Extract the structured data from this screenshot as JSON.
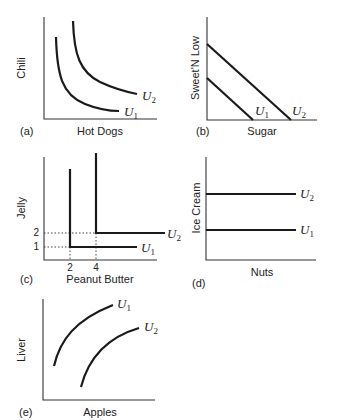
{
  "panels": {
    "a": {
      "tag": "(a)",
      "xlabel": "Hot Dogs",
      "ylabel": "Chili",
      "curves": [
        {
          "name": "U",
          "sub": "1"
        },
        {
          "name": "U",
          "sub": "2"
        }
      ],
      "shape": "convex indifference curves"
    },
    "b": {
      "tag": "(b)",
      "xlabel": "Sugar",
      "ylabel": "Sweet'N Low",
      "curves": [
        {
          "name": "U",
          "sub": "1"
        },
        {
          "name": "U",
          "sub": "2"
        }
      ],
      "shape": "perfect substitutes (straight lines)"
    },
    "c": {
      "tag": "(c)",
      "xlabel": "Peanut Butter",
      "ylabel": "Jelly",
      "curves": [
        {
          "name": "U",
          "sub": "1"
        },
        {
          "name": "U",
          "sub": "2"
        }
      ],
      "xticks": [
        "2",
        "4"
      ],
      "yticks": [
        "1",
        "2"
      ],
      "shape": "perfect complements (L-shaped)"
    },
    "d": {
      "tag": "(d)",
      "xlabel": "Nuts",
      "ylabel": "Ice Cream",
      "curves": [
        {
          "name": "U",
          "sub": "1"
        },
        {
          "name": "U",
          "sub": "2"
        }
      ],
      "shape": "horizontal lines (neutral good)"
    },
    "e": {
      "tag": "(e)",
      "xlabel": "Apples",
      "ylabel": "Liver",
      "curves": [
        {
          "name": "U",
          "sub": "1"
        },
        {
          "name": "U",
          "sub": "2"
        }
      ],
      "shape": "upward sloping (bad on y-axis)"
    }
  }
}
